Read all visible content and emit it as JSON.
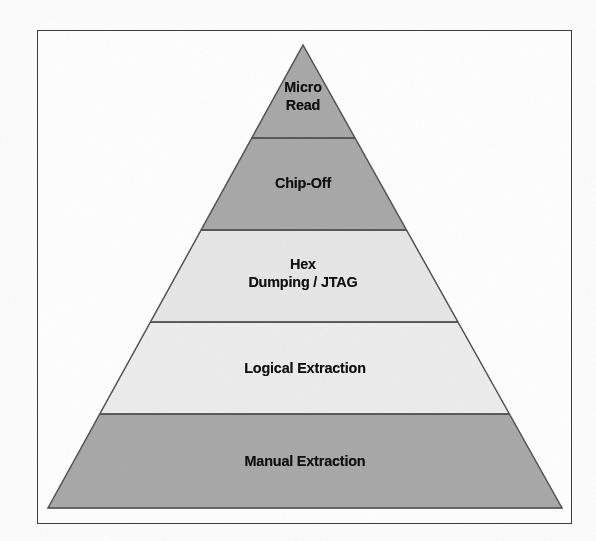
{
  "figure": {
    "kind": "pyramid-diagram",
    "frame": {
      "border_color": "#3c3c3c",
      "background_color": "#ffffff"
    }
  },
  "chart_data": {
    "type": "pie",
    "chart_style": "pyramid",
    "title": "",
    "xlabel": "",
    "ylabel": "",
    "orientation": "apex-top",
    "legend_position": "none",
    "grid": false,
    "categories": [
      "Micro Read",
      "Chip-Off",
      "Hex Dumping / JTAG",
      "Logical Extraction",
      "Manual Extraction"
    ],
    "values": [
      1,
      2,
      3,
      4,
      5
    ],
    "series": [
      {
        "name": "levels",
        "values": [
          1,
          2,
          3,
          4,
          5
        ]
      }
    ],
    "annotations": [
      "Micro Read",
      "Chip-Off",
      "Hex Dumping / JTAG",
      "Logical Extraction",
      "Manual Extraction"
    ]
  },
  "pyramid": {
    "apex": {
      "x": 303,
      "y": 45
    },
    "base_left": {
      "x": 48,
      "y": 508
    },
    "base_right": {
      "x": 562,
      "y": 508
    },
    "outline_color": "#58585a",
    "divider_color": "#4c4c4e",
    "levels": [
      {
        "id": "micro-read",
        "label": "Micro\nRead",
        "label_line_1": "Micro",
        "label_line_2": "Read",
        "fill": "#a9a9a9",
        "y_top": 45,
        "y_bottom": 138
      },
      {
        "id": "chip-off",
        "label": "Chip-Off",
        "label_line_1": "Chip-Off",
        "label_line_2": "",
        "fill": "#a9a9a9",
        "y_top": 138,
        "y_bottom": 230
      },
      {
        "id": "hex-dumping",
        "label": "Hex\nDumping / JTAG",
        "label_line_1": "Hex",
        "label_line_2": "Dumping / JTAG",
        "fill": "#e7e7e7",
        "y_top": 230,
        "y_bottom": 322
      },
      {
        "id": "logical-extraction",
        "label": "Logical Extraction",
        "label_line_1": "Logical Extraction",
        "label_line_2": "",
        "fill": "#ededed",
        "y_top": 322,
        "y_bottom": 414
      },
      {
        "id": "manual-extraction",
        "label": "Manual Extraction",
        "label_line_1": "Manual Extraction",
        "label_line_2": "",
        "fill": "#a9a9a9",
        "y_top": 414,
        "y_bottom": 508
      }
    ]
  }
}
